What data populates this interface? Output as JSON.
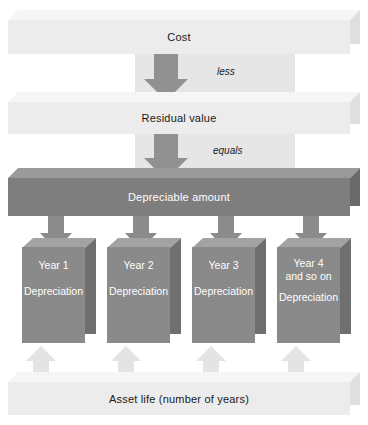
{
  "diagram": {
    "bars": {
      "cost": {
        "label": "Cost"
      },
      "residual": {
        "label": "Residual value"
      },
      "depreciable": {
        "label": "Depreciable amount"
      },
      "asset_life": {
        "label": "Asset life (number of years)"
      }
    },
    "connectors": [
      {
        "name": "less",
        "label": "less"
      },
      {
        "name": "equals",
        "label": "equals"
      }
    ],
    "years": [
      {
        "year_label": "Year 1",
        "sub_label": "",
        "amount_label": "Depreciation"
      },
      {
        "year_label": "Year 2",
        "sub_label": "",
        "amount_label": "Depreciation"
      },
      {
        "year_label": "Year 3",
        "sub_label": "",
        "amount_label": "Depreciation"
      },
      {
        "year_label": "Year 4",
        "sub_label": "and so on",
        "amount_label": "Depreciation"
      }
    ],
    "colors": {
      "light_slab_face": "#ececec",
      "light_slab_top": "#f6f6f6",
      "light_slab_side": "#dfdfdf",
      "dark_slab_face": "#7e7e7e",
      "cube_front": "#8a8a8a",
      "cube_top": "#a3a3a3",
      "cube_side": "#6f6f6f",
      "down_arrow": "#8b8b8b",
      "up_arrow": "#e4e4e4",
      "band": "#e6e6e6",
      "background": "#ffffff",
      "dark_text": "#1a1a1a",
      "light_text": "#ffffff"
    }
  }
}
